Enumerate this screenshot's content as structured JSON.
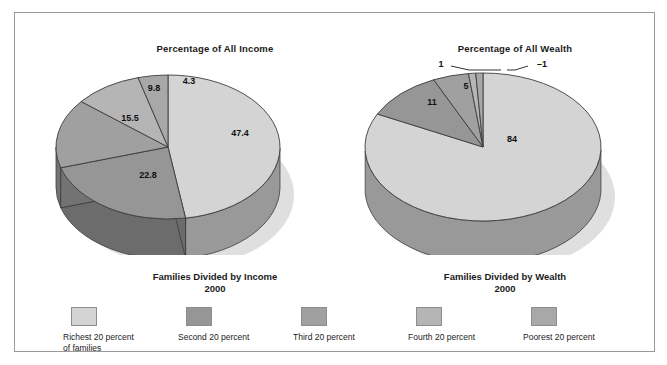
{
  "figure": {
    "background_color": "#ffffff",
    "frame_border_color": "#9a9a9a"
  },
  "charts": [
    {
      "id": "income",
      "title": "Percentage of All Income",
      "legend_title_line1": "Families Divided by Income",
      "legend_title_line2": "2000"
    },
    {
      "id": "wealth",
      "title": "Percentage of All Wealth",
      "legend_title_line1": "Families Divided by Wealth",
      "legend_title_line2": "2000"
    }
  ],
  "legend": {
    "items": [
      {
        "label_line1": "Richest 20 percent",
        "label_line2": "of families",
        "color": "#d4d4d4"
      },
      {
        "label_line1": "Second 20 percent",
        "label_line2": "",
        "color": "#969696"
      },
      {
        "label_line1": "Third 20 percent",
        "label_line2": "",
        "color": "#a0a0a0"
      },
      {
        "label_line1": "Fourth 20 percent",
        "label_line2": "",
        "color": "#b5b5b5"
      },
      {
        "label_line1": "Poorest 20 percent",
        "label_line2": "",
        "color": "#a8a8a8"
      }
    ]
  },
  "labels": {
    "income": {
      "s1": "47.4",
      "s2": "22.8",
      "s3": "15.5",
      "s4": "9.8",
      "s5": "4.3"
    },
    "wealth": {
      "s1": "84",
      "s2": "11",
      "s3": "5",
      "s4": "1",
      "s5": "–1"
    }
  },
  "chart_data": [
    {
      "type": "pie",
      "id": "income",
      "title": "Percentage of All Income",
      "subtitle": "Families Divided by Income 2000",
      "unit": "percent",
      "categories": [
        "Richest 20 percent of families",
        "Second 20 percent",
        "Third 20 percent",
        "Fourth 20 percent",
        "Poorest 20 percent"
      ],
      "values": [
        47.4,
        22.8,
        15.5,
        9.8,
        4.3
      ],
      "labels": [
        "47.4",
        "22.8",
        "15.5",
        "9.8",
        "4.3"
      ],
      "colors": [
        "#d4d4d4",
        "#969696",
        "#a0a0a0",
        "#b5b5b5",
        "#a8a8a8"
      ],
      "three_d": true,
      "legend_position": "bottom",
      "grid": false
    },
    {
      "type": "pie",
      "id": "wealth",
      "title": "Percentage of All Wealth",
      "subtitle": "Families Divided by Wealth 2000",
      "unit": "percent",
      "categories": [
        "Richest 20 percent of families",
        "Second 20 percent",
        "Third 20 percent",
        "Fourth 20 percent",
        "Poorest 20 percent"
      ],
      "values": [
        84,
        11,
        5,
        1,
        -1
      ],
      "labels": [
        "84",
        "11",
        "5",
        "1",
        "–1"
      ],
      "colors": [
        "#d4d4d4",
        "#969696",
        "#a0a0a0",
        "#b5b5b5",
        "#a8a8a8"
      ],
      "three_d": true,
      "legend_position": "bottom",
      "grid": false
    }
  ]
}
